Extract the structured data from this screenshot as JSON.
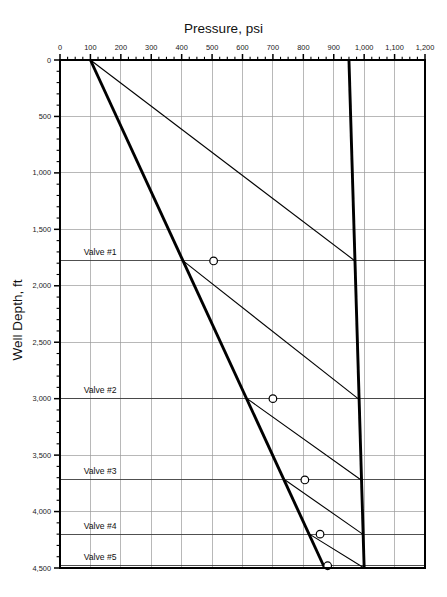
{
  "chart_data": {
    "type": "line",
    "title": "Pressure, psi",
    "xlabel": "Pressure, psi",
    "ylabel": "Well Depth, ft",
    "xlim": [
      0,
      1200
    ],
    "ylim": [
      0,
      4500
    ],
    "y_inverted": true,
    "grid": true,
    "legend": "none",
    "x_ticks": [
      0,
      100,
      200,
      300,
      400,
      500,
      600,
      700,
      800,
      900,
      1000,
      1100,
      1200
    ],
    "x_tick_labels": [
      "0",
      "100",
      "200",
      "300",
      "400",
      "500",
      "600",
      "700",
      "800",
      "900",
      "1,000",
      "1,100",
      "1,200"
    ],
    "x_minor_interval": 25,
    "y_ticks": [
      0,
      500,
      1000,
      1500,
      2000,
      2500,
      3000,
      3500,
      4000,
      4500
    ],
    "y_tick_labels": [
      "0",
      "500",
      "1,000",
      "1,500",
      "2,000",
      "2,500",
      "3,000",
      "3,500",
      "4,000",
      "4,500"
    ],
    "y_minor_interval": 100,
    "series": [
      {
        "name": "gas-injection-pressure",
        "style": "thick",
        "points": [
          [
            950,
            0
          ],
          [
            1000,
            4500
          ]
        ]
      },
      {
        "name": "production-flowing-gradient",
        "style": "thick",
        "points": [
          [
            100,
            0
          ],
          [
            870,
            4500
          ]
        ]
      },
      {
        "name": "kickoff-unloading-gradient",
        "style": "thin",
        "points": [
          [
            100,
            0
          ],
          [
            970,
            1780
          ]
        ]
      },
      {
        "name": "transfer-gradient-valve-1",
        "style": "thin",
        "points": [
          [
            405,
            1780
          ],
          [
            980,
            3000
          ]
        ]
      },
      {
        "name": "transfer-gradient-valve-2",
        "style": "thin",
        "points": [
          [
            615,
            3000
          ],
          [
            990,
            3720
          ]
        ]
      },
      {
        "name": "transfer-gradient-valve-3",
        "style": "thin",
        "points": [
          [
            740,
            3720
          ],
          [
            995,
            4200
          ]
        ]
      },
      {
        "name": "transfer-gradient-valve-4",
        "style": "thin",
        "points": [
          [
            820,
            4200
          ],
          [
            1000,
            4500
          ]
        ]
      }
    ],
    "valves": [
      {
        "label": "Valve #1",
        "depth": 1780,
        "marker_pressure": 505
      },
      {
        "label": "Valve #2",
        "depth": 3000,
        "marker_pressure": 700
      },
      {
        "label": "Valve #3",
        "depth": 3720,
        "marker_pressure": 805
      },
      {
        "label": "Valve #4",
        "depth": 4200,
        "marker_pressure": 855
      },
      {
        "label": "Valve #5",
        "depth": 4480,
        "marker_pressure": 880
      }
    ],
    "valve_label_pressure": 35
  }
}
